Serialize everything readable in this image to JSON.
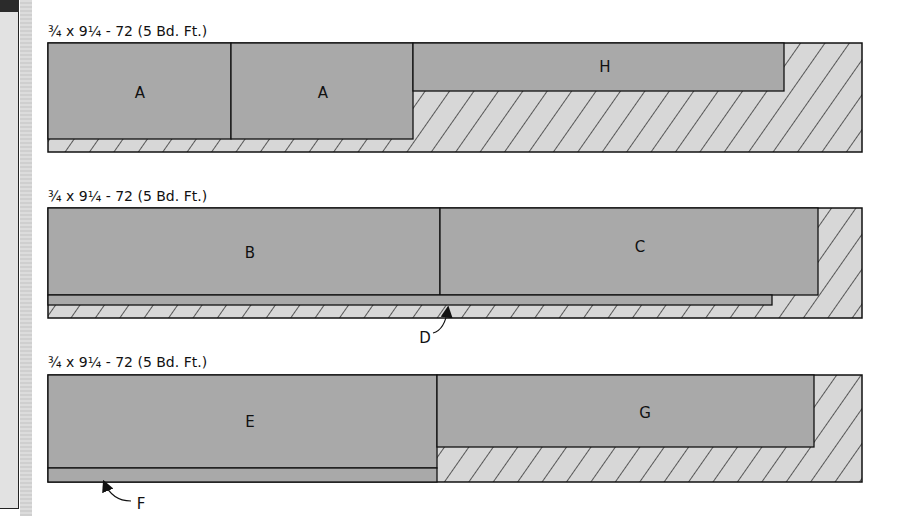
{
  "colors": {
    "piece_fill": "#a9a9a9",
    "waste_fill": "#d7d7d7",
    "outline": "#111111",
    "hatch": "#111111"
  },
  "boards": [
    {
      "label": "¾ x 9¼ - 72 (5 Bd. Ft.)",
      "pieces": [
        {
          "id": "A",
          "label": "A"
        },
        {
          "id": "A2",
          "label": "A"
        },
        {
          "id": "H",
          "label": "H"
        }
      ]
    },
    {
      "label": "¾ x 9¼ - 72 (5 Bd. Ft.)",
      "pieces": [
        {
          "id": "B",
          "label": "B"
        },
        {
          "id": "C",
          "label": "C"
        },
        {
          "id": "D",
          "label": "D"
        }
      ],
      "callout": "D"
    },
    {
      "label": "¾ x 9¼ - 72 (5 Bd. Ft.)",
      "pieces": [
        {
          "id": "E",
          "label": "E"
        },
        {
          "id": "G",
          "label": "G"
        },
        {
          "id": "F",
          "label": "F"
        }
      ],
      "callout": "F"
    }
  ]
}
